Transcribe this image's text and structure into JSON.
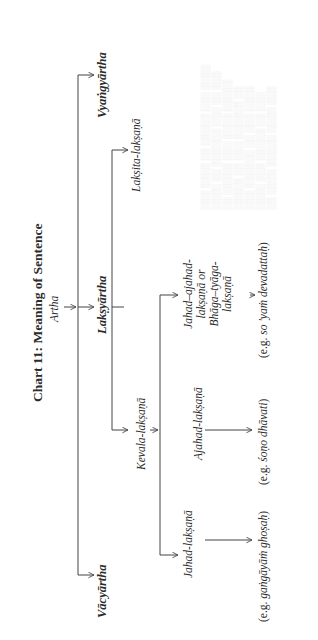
{
  "chart": {
    "title": "Chart 11: Meaning of Sentence",
    "root": "Artha",
    "level1": {
      "vacyartha": "Vācyārtha",
      "laksyartha": "Lakṣyārtha",
      "vyangyartha": "Vyaṅgyārtha"
    },
    "level2": {
      "kevala": "Kevala-lakṣaṇā",
      "laksita": "Lakṣita-lakṣaṇā"
    },
    "level3": {
      "jahad": "Jahad-lakṣaṇā",
      "ajahad": "Ajahad-lakṣaṇā",
      "jahad_ajahad_lines": [
        "Jahad–ajahad-",
        "lakṣaṇā or",
        "Bhāga–tyāga-",
        "lakṣaṇā"
      ]
    },
    "examples": {
      "jahad_prefix": "(e.g. ",
      "jahad_text": "gaṅgāyāṁ ghoṣaḥ",
      "jahad_suffix": ")",
      "ajahad_prefix": "(e.g. ",
      "ajahad_text": "śoṇo dhāvati",
      "ajahad_suffix": ")",
      "jahad_ajahad_prefix": "(e.g. ",
      "jahad_ajahad_text": "so 'yaṁ devadattaḥ",
      "jahad_ajahad_suffix": ")"
    }
  },
  "colors": {
    "ink": "#2b2b2b",
    "line": "#444444",
    "bleed_through": "#d8d8d8"
  }
}
